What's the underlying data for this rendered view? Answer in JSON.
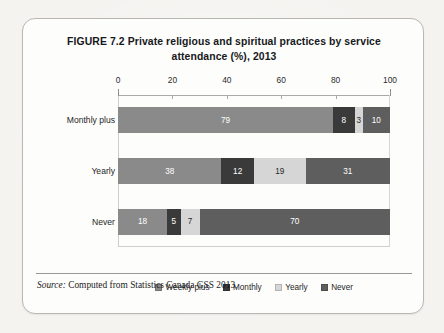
{
  "figure": {
    "title": "FIGURE 7.2  Private religious and spiritual practices by service attendance (%), 2013",
    "source_label": "Source:",
    "source_text": "Computed from Statistics Canada GSS 2013."
  },
  "chart_data": {
    "type": "bar",
    "orientation": "horizontal",
    "stacked": true,
    "title": "FIGURE 7.2  Private religious and spiritual practices by service attendance (%), 2013",
    "xlabel": "",
    "ylabel": "",
    "xlim": [
      0,
      100
    ],
    "xticks": [
      0,
      20,
      40,
      60,
      80,
      100
    ],
    "xticklabels": [
      "0",
      "20",
      "40",
      "60",
      "80",
      "100"
    ],
    "grid": false,
    "legend_position": "bottom",
    "categories": [
      "Monthly plus",
      "Yearly",
      "Never"
    ],
    "series": [
      {
        "name": "Weekly plus",
        "color": "#8a8a8a",
        "values": [
          79,
          38,
          18
        ]
      },
      {
        "name": "Monthly",
        "color": "#3a3a3a",
        "values": [
          8,
          12,
          5
        ]
      },
      {
        "name": "Yearly",
        "color": "#d6d6d6",
        "values": [
          3,
          19,
          7
        ]
      },
      {
        "name": "Never",
        "color": "#5e5e5e",
        "values": [
          10,
          31,
          70
        ]
      }
    ],
    "bars": [
      {
        "category": "Monthly plus",
        "segments": [
          {
            "series": "Weekly plus",
            "value": 79,
            "label": "79",
            "color": "#8a8a8a",
            "text": "light"
          },
          {
            "series": "Monthly",
            "value": 8,
            "label": "8",
            "color": "#3a3a3a",
            "text": "light"
          },
          {
            "series": "Yearly",
            "value": 3,
            "label": "3",
            "color": "#d6d6d6",
            "text": "dark"
          },
          {
            "series": "Never",
            "value": 10,
            "label": "10",
            "color": "#5e5e5e",
            "text": "light"
          }
        ]
      },
      {
        "category": "Yearly",
        "segments": [
          {
            "series": "Weekly plus",
            "value": 38,
            "label": "38",
            "color": "#8a8a8a",
            "text": "light"
          },
          {
            "series": "Monthly",
            "value": 12,
            "label": "12",
            "color": "#3a3a3a",
            "text": "light"
          },
          {
            "series": "Yearly",
            "value": 19,
            "label": "19",
            "color": "#d6d6d6",
            "text": "dark"
          },
          {
            "series": "Never",
            "value": 31,
            "label": "31",
            "color": "#5e5e5e",
            "text": "light"
          }
        ]
      },
      {
        "category": "Never",
        "segments": [
          {
            "series": "Weekly plus",
            "value": 18,
            "label": "18",
            "color": "#8a8a8a",
            "text": "light"
          },
          {
            "series": "Monthly",
            "value": 5,
            "label": "5",
            "color": "#3a3a3a",
            "text": "light"
          },
          {
            "series": "Yearly",
            "value": 7,
            "label": "7",
            "color": "#d6d6d6",
            "text": "dark"
          },
          {
            "series": "Never",
            "value": 70,
            "label": "70",
            "color": "#5e5e5e",
            "text": "light"
          }
        ]
      }
    ]
  }
}
